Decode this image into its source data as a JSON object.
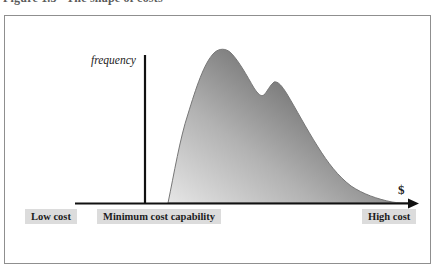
{
  "page": {
    "caption_top": "Figure 1.3   The shape of costs"
  },
  "diagram": {
    "y_axis_label": "frequency",
    "x_axis_label": "$",
    "axis_labels": [
      {
        "id": "low",
        "label": "Low cost"
      },
      {
        "id": "minimum",
        "label": "Minimum cost capability"
      },
      {
        "id": "high",
        "label": "High cost"
      }
    ],
    "curve": {
      "type": "frequency-distribution",
      "shape": "bimodal, right-skewed with long tail toward high cost",
      "main_peak_relative_x": 0.25,
      "secondary_peak_relative_x": 0.45,
      "fill_gradient": [
        "#e6e6e6",
        "#b2b2b2",
        "#565656"
      ]
    },
    "colors": {
      "label_background": "#dcdcdc",
      "axis": "#111111",
      "frame_border": "#8f8f8f",
      "text": "#1c1c1c"
    }
  }
}
